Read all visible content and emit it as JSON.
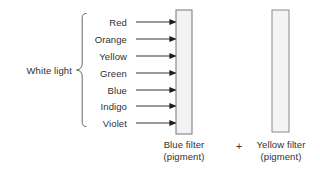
{
  "figure": {
    "type": "optics-diagram",
    "title_text": "",
    "source_label": "White light",
    "spectrum_colors": [
      {
        "name": "Red",
        "y": 22
      },
      {
        "name": "Orange",
        "y": 39
      },
      {
        "name": "Yellow",
        "y": 56
      },
      {
        "name": "Green",
        "y": 73
      },
      {
        "name": "Blue",
        "y": 90
      },
      {
        "name": "Indigo",
        "y": 106
      },
      {
        "name": "Violet",
        "y": 123
      }
    ],
    "operator": "+",
    "filters": [
      {
        "id": "blue-filter",
        "name": "Blue filter",
        "sub": "(pigment)",
        "x": 176,
        "y": 10,
        "width": 16,
        "height": 124,
        "fill": "#f2f2f2",
        "stroke": "#777777"
      },
      {
        "id": "yellow-filter",
        "name": "Yellow filter",
        "sub": "(pigment)",
        "x": 272,
        "y": 10,
        "width": 17,
        "height": 122,
        "fill": "#f4f4f4",
        "stroke": "#8a8a8a"
      }
    ],
    "ray": {
      "start_x": 136,
      "end_x": 176,
      "color": "#1d1d1d",
      "count": 7
    },
    "brace": {
      "x_spine": 82,
      "x_tip": 76,
      "top_y": 13,
      "bottom_y": 126,
      "mid_y": 70,
      "color": "#4a4a4a"
    },
    "label_right_edge": 132,
    "palette": {
      "ink": "#2b2b2b",
      "rule": "#1d1d1d",
      "background": "#ffffff"
    }
  }
}
